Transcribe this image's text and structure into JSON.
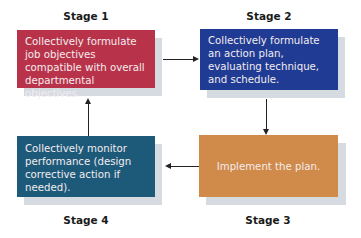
{
  "stages": [
    {
      "label": "Stage 1",
      "text": "Collectively formulate job objectives compatible with overall departmental objectives.",
      "color": "#b8334a"
    },
    {
      "label": "Stage 2",
      "text": "Collectively formulate an action plan, evaluating technique, and schedule.",
      "color": "#1f3b93"
    },
    {
      "label": "Stage 3",
      "text": "Implement the plan.",
      "color": "#d08a4a"
    },
    {
      "label": "Stage 4",
      "text": "Collectively monitor performance (design corrective action if needed).",
      "color": "#1d5a7a"
    }
  ],
  "flow": [
    "Stage 1 -> Stage 2",
    "Stage 2 -> Stage 3",
    "Stage 3 -> Stage 4",
    "Stage 4 -> Stage 1"
  ]
}
